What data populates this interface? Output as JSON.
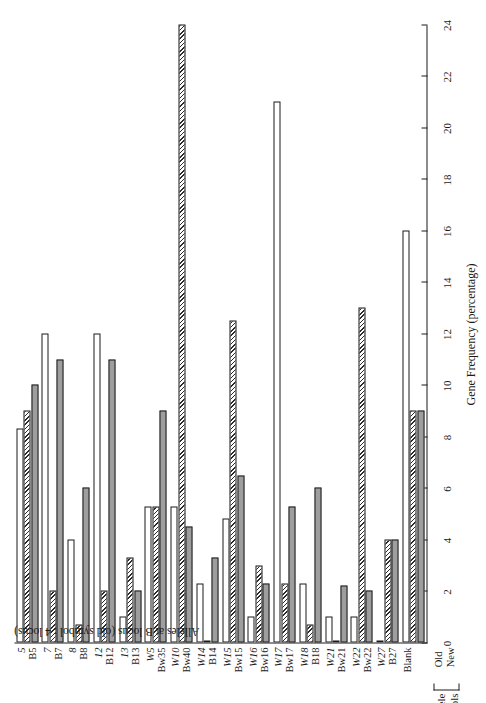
{
  "chart_data": {
    "type": "bar",
    "orientation": "horizontal",
    "title": "",
    "xlabel": "Gene Frequency (percentage)",
    "ylabel": "Alleles at B locus (old symbol : 4 locus)",
    "xlim": [
      0,
      24
    ],
    "grid": false,
    "tick_values": [
      0,
      2,
      4,
      6,
      8,
      10,
      12,
      14,
      16,
      18,
      20,
      22,
      24
    ],
    "tick_labels": [
      "0",
      "2",
      "4",
      "6",
      "8",
      "10",
      "12",
      "14",
      "16",
      "18",
      "20",
      "22",
      "24"
    ],
    "legend_title": "Allele symbols",
    "legend_rows": [
      "Old",
      "New"
    ],
    "categories_old": [
      "5",
      "7",
      "8",
      "12",
      "13",
      "W5",
      "W10",
      "W14",
      "W15",
      "W16",
      "W17",
      "W18",
      "W21",
      "W22",
      "W27",
      ""
    ],
    "categories_new": [
      "B5",
      "B7",
      "B8",
      "B12",
      "B13",
      "Bw35",
      "Bw40",
      "B14",
      "Bw15",
      "Bw16",
      "Bw17",
      "B18",
      "Bw21",
      "Bw22",
      "B27",
      "Blank"
    ],
    "categories": [
      {
        "old": "5",
        "new": "B5"
      },
      {
        "old": "7",
        "new": "B7"
      },
      {
        "old": "8",
        "new": "B8"
      },
      {
        "old": "12",
        "new": "B12"
      },
      {
        "old": "13",
        "new": "B13"
      },
      {
        "old": "W5",
        "new": "Bw35"
      },
      {
        "old": "W10",
        "new": "Bw40"
      },
      {
        "old": "W14",
        "new": "B14"
      },
      {
        "old": "W15",
        "new": "Bw15"
      },
      {
        "old": "W16",
        "new": "Bw16"
      },
      {
        "old": "W17",
        "new": "Bw17"
      },
      {
        "old": "W18",
        "new": "B18"
      },
      {
        "old": "W21",
        "new": "Bw21"
      },
      {
        "old": "W22",
        "new": "Bw22"
      },
      {
        "old": "W27",
        "new": "B27"
      },
      {
        "old": "",
        "new": "Blank"
      }
    ],
    "series": [
      {
        "name": "series-white",
        "style": "white",
        "values": [
          8.3,
          12.0,
          4.0,
          12.0,
          1.0,
          5.3,
          5.3,
          2.3,
          4.8,
          1.0,
          21.0,
          2.3,
          1.0,
          1.0,
          0.0,
          16.0
        ]
      },
      {
        "name": "series-hatched",
        "style": "hatch",
        "values": [
          9.0,
          2.0,
          0.7,
          2.0,
          3.3,
          5.3,
          24.0,
          0.0,
          12.5,
          3.0,
          2.3,
          0.7,
          0.0,
          13.0,
          4.0,
          9.0
        ]
      },
      {
        "name": "series-gray",
        "style": "gray",
        "values": [
          10.0,
          11.0,
          6.0,
          11.0,
          2.0,
          9.0,
          4.5,
          3.3,
          6.5,
          2.3,
          5.3,
          6.0,
          2.2,
          2.0,
          4.0,
          9.0
        ]
      }
    ]
  }
}
